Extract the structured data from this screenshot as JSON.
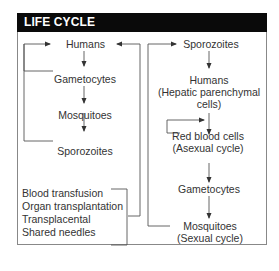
{
  "header": {
    "title": "LIFE CYCLE"
  },
  "left_column": {
    "nodes": [
      "Humans",
      "Gametocytes",
      "Mosquitoes",
      "Sporozoites"
    ]
  },
  "right_column": {
    "nodes": [
      {
        "line1": "Sporozoites"
      },
      {
        "line1": "Humans",
        "line2": "(Hepatic parenchymal",
        "line3": "cells)"
      },
      {
        "line1": "Red blood cells",
        "line2": "(Asexual cycle)"
      },
      {
        "line1": "Gametocytes"
      },
      {
        "line1": "Mosquitoes",
        "line2": "(Sexual cycle)"
      }
    ]
  },
  "transmission_routes": [
    "Blood transfusion",
    "Organ transplantation",
    "Transplacental",
    "Shared needles"
  ],
  "colors": {
    "header_bg": "#0a0a0a",
    "header_text": "#ffffff",
    "line": "#444444",
    "text": "#333333"
  }
}
